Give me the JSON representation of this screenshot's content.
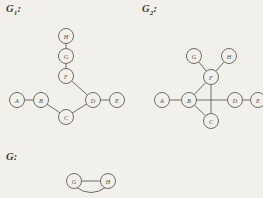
{
  "page": {
    "width": 263,
    "height": 198,
    "background_color": "#f2f0ea",
    "ink_color": "#6f6d68",
    "text_color": "#3b3a36"
  },
  "figures": [
    {
      "id": "g1",
      "label_main": "G",
      "label_sub": "1",
      "label_suffix": ":",
      "label_x": 6,
      "label_y": 8,
      "description": "tree with eight vertices",
      "nodes": [
        {
          "id": "A",
          "label": "A",
          "x": 17,
          "y": 100
        },
        {
          "id": "B",
          "label": "B",
          "x": 41,
          "y": 100
        },
        {
          "id": "C",
          "label": "C",
          "x": 66,
          "y": 117
        },
        {
          "id": "D",
          "label": "D",
          "x": 93,
          "y": 100
        },
        {
          "id": "E",
          "label": "E",
          "x": 117,
          "y": 100
        },
        {
          "id": "F",
          "label": "F",
          "x": 66,
          "y": 76
        },
        {
          "id": "G",
          "label": "G",
          "x": 66,
          "y": 56
        },
        {
          "id": "H",
          "label": "H",
          "x": 66,
          "y": 36
        }
      ],
      "edges": [
        {
          "from": "A",
          "to": "B"
        },
        {
          "from": "B",
          "to": "C"
        },
        {
          "from": "C",
          "to": "D"
        },
        {
          "from": "D",
          "to": "E"
        },
        {
          "from": "D",
          "to": "F"
        },
        {
          "from": "F",
          "to": "G"
        },
        {
          "from": "G",
          "to": "H"
        }
      ]
    },
    {
      "id": "g2",
      "label_main": "G",
      "label_sub": "2",
      "label_suffix": ":",
      "label_x": 142,
      "label_y": 8,
      "description": "graph with eight vertices and crossing edges",
      "nodes": [
        {
          "id": "A",
          "label": "A",
          "x": 162,
          "y": 100
        },
        {
          "id": "B",
          "label": "B",
          "x": 189,
          "y": 100
        },
        {
          "id": "C",
          "label": "C",
          "x": 211,
          "y": 121
        },
        {
          "id": "D",
          "label": "D",
          "x": 235,
          "y": 100
        },
        {
          "id": "E",
          "label": "E",
          "x": 258,
          "y": 100
        },
        {
          "id": "F",
          "label": "F",
          "x": 211,
          "y": 77
        },
        {
          "id": "G",
          "label": "G",
          "x": 194,
          "y": 56
        },
        {
          "id": "H",
          "label": "H",
          "x": 229,
          "y": 56
        }
      ],
      "edges": [
        {
          "from": "A",
          "to": "B"
        },
        {
          "from": "B",
          "to": "C"
        },
        {
          "from": "B",
          "to": "F"
        },
        {
          "from": "B",
          "to": "D"
        },
        {
          "from": "F",
          "to": "C"
        },
        {
          "from": "F",
          "to": "G"
        },
        {
          "from": "F",
          "to": "H"
        },
        {
          "from": "D",
          "to": "E"
        }
      ]
    },
    {
      "id": "g",
      "label_main": "G",
      "label_sub": "",
      "label_suffix": ":",
      "label_x": 6,
      "label_y": 155,
      "description": "two vertices joined by a straight edge and a curved parallel edge",
      "nodes": [
        {
          "id": "G",
          "label": "G",
          "x": 74,
          "y": 181
        },
        {
          "id": "H",
          "label": "H",
          "x": 108,
          "y": 181
        }
      ],
      "edges": [
        {
          "from": "G",
          "to": "H",
          "style": "straight"
        },
        {
          "from": "G",
          "to": "H",
          "style": "curved-below"
        }
      ]
    }
  ],
  "node_radius": 7.5
}
